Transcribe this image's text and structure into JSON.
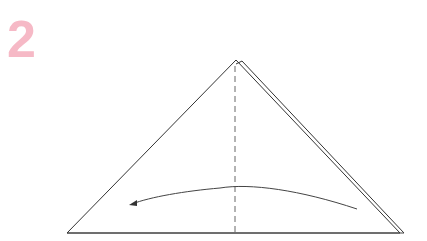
{
  "step": {
    "number": "2",
    "color": "#f6b9c6"
  },
  "diagram": {
    "line_color": "#333333",
    "dash_color": "#555555",
    "arrow_color": "#444444"
  }
}
